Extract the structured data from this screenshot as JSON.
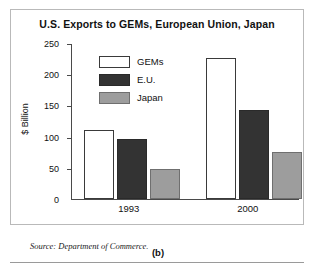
{
  "chart_data": {
    "type": "bar",
    "title": "U.S. Exports to GEMs, European Union, Japan",
    "xlabel": "",
    "ylabel": "$ Billion",
    "categories": [
      "1993",
      "2000"
    ],
    "series": [
      {
        "name": "GEMs",
        "values": [
          112,
          228
        ],
        "color": "#ffffff"
      },
      {
        "name": "E.U.",
        "values": [
          96,
          143
        ],
        "color": "#333333"
      },
      {
        "name": "Japan",
        "values": [
          48,
          76
        ],
        "color": "#9d9d9d"
      }
    ],
    "ylim": [
      0,
      250
    ],
    "yticks": [
      0,
      50,
      100,
      150,
      200,
      250
    ],
    "ytick_labels": [
      "0",
      "50",
      "100",
      "150",
      "200",
      "250"
    ],
    "grid": false,
    "legend_position": "upper-left-inside"
  },
  "notes": {
    "source": "Source: Department of Commerce.",
    "caption": "(b)"
  }
}
